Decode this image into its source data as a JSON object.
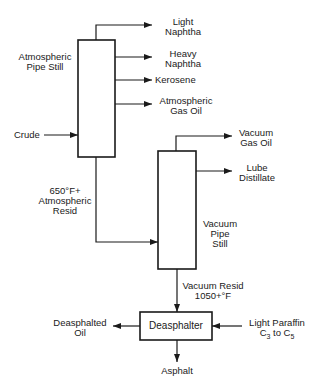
{
  "diagram": {
    "type": "process-flow",
    "units": {
      "atmospheric": {
        "line1": "Atmospheric",
        "line2": "Pipe  Still"
      },
      "vacuum": {
        "line1": "Vacuum",
        "line2": "Pipe",
        "line3": "Still"
      },
      "deasphalter": {
        "label": "Deasphalter"
      }
    },
    "streams": {
      "crude": "Crude",
      "light_naphtha": {
        "line1": "Light",
        "line2": "Naphtha"
      },
      "heavy_naphtha": {
        "line1": "Heavy",
        "line2": "Naphtha"
      },
      "kerosene": "Kerosene",
      "ago": {
        "line1": "Atmospheric",
        "line2": "Gas  Oil"
      },
      "atm_resid": {
        "line1": "650°F+",
        "line2": "Atmospheric",
        "line3": "Resid"
      },
      "vgo": {
        "line1": "Vacuum",
        "line2": "Gas  Oil"
      },
      "lube": {
        "line1": "Lube",
        "line2": "Distillate"
      },
      "vac_resid": {
        "line1": "Vacuum  Resid",
        "line2": "1050+°F"
      },
      "dao": {
        "line1": "Deasphalted",
        "line2": "Oil"
      },
      "solvent": {
        "line1": "Light  Paraffin",
        "line2a": "C",
        "sub1": "3",
        "mid": " to C",
        "sub2": "5"
      },
      "asphalt": "Asphalt"
    }
  }
}
